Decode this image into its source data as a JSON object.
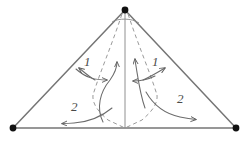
{
  "figure": {
    "background_color": "#ffffff",
    "width": 249,
    "height": 144,
    "stroke_color_outline": "#707070",
    "stroke_color_flow": "#6b6b6b",
    "stroke_color_dashed": "#8a8a8a",
    "vertex_color": "#1a1a1a"
  },
  "vertices": {
    "apex": {
      "label": "apex-vertex",
      "x": 125,
      "y": 10
    },
    "bottom_left": {
      "label": "bottom-left-vertex",
      "x": 13,
      "y": 128
    },
    "bottom_right": {
      "label": "bottom-right-vertex",
      "x": 236,
      "y": 128
    },
    "bottom_center": {
      "label": "bottom-center-point",
      "x": 125,
      "y": 128
    }
  },
  "labels": [
    {
      "id": "label-1-left",
      "text": "1",
      "x": 84,
      "y": 55
    },
    {
      "id": "label-1-right",
      "text": "1",
      "x": 152,
      "y": 55
    },
    {
      "id": "label-2-left",
      "text": "2",
      "x": 71,
      "y": 100
    },
    {
      "id": "label-2-right",
      "text": "2",
      "x": 177,
      "y": 92
    }
  ],
  "elements": {
    "triangle_outline": "triangle-outline",
    "center_line": "center-vertical-line",
    "dashed_left_upper": "dashed-left-upper-curve",
    "dashed_right_upper": "dashed-right-upper-curve",
    "dashed_left_lower": "dashed-left-lower-line",
    "dashed_right_lower": "dashed-right-lower-line",
    "apex_arc": "apex-arc",
    "flow_left_up": "flow-arrow-left-upward",
    "flow_right_up": "flow-arrow-right-upward",
    "flow_left_inward": "flow-arrow-left-inward",
    "flow_right_inward": "flow-arrow-right-inward",
    "flow_left_outward": "flow-arrow-left-outward",
    "flow_right_outward": "flow-arrow-right-outward",
    "flow_left_bottom": "flow-arrow-left-bottom",
    "flow_right_bottom": "flow-arrow-right-bottom"
  }
}
